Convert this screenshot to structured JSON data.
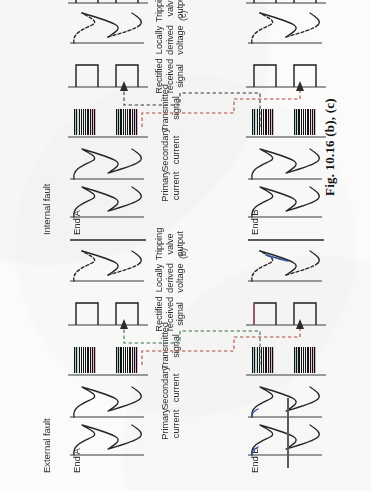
{
  "figure": {
    "caption": "Fig. 10.16 (b), (c)",
    "parts": [
      {
        "id": "b",
        "part_label": "(b)",
        "condition_title": "External fault",
        "ends": [
          "End A",
          "End B"
        ],
        "rows": [
          {
            "key": "primary_current",
            "label": "Primary\ncurrent",
            "type": "sine"
          },
          {
            "key": "secondary_current",
            "label": "Secondary\ncurrent",
            "type": "sine"
          },
          {
            "key": "transmitted_signal",
            "label": "Transmitted\nsignal",
            "type": "hatch-blocks"
          },
          {
            "key": "rectified_received",
            "label": "Rectified\nreceived\nsignal",
            "type": "square-pulses"
          },
          {
            "key": "locally_derived",
            "label": "Locally\nderived\nvoltage",
            "type": "sine-dashed"
          },
          {
            "key": "tripping_output",
            "label": "Tripping\nvalve\noutput",
            "type": "flat"
          }
        ]
      },
      {
        "id": "c",
        "part_label": "(c)",
        "condition_title": "Internal fault",
        "ends": [
          "End A",
          "End B"
        ],
        "rows": [
          {
            "key": "primary_current",
            "label": "Primary\ncurrent",
            "type": "sine"
          },
          {
            "key": "secondary_current",
            "label": "Secondary\ncurrent",
            "type": "sine"
          },
          {
            "key": "transmitted_signal",
            "label": "Transmitted\nsignal",
            "type": "hatch-blocks"
          },
          {
            "key": "rectified_received",
            "label": "Rectified\nreceived\nsignal",
            "type": "square-pulses"
          },
          {
            "key": "locally_derived",
            "label": "Locally\nderived\nvoltage",
            "type": "sine-dashed"
          },
          {
            "key": "tripping_output",
            "label": "Tripping\nvalve\noutput",
            "type": "square-pulses"
          }
        ]
      }
    ]
  },
  "colors": {
    "ink": "#262626",
    "paper": "#fbfbfa",
    "link_red": "#b0493f",
    "link_green": "#3d6b55",
    "fringe_blue": "#2f4f9e"
  }
}
